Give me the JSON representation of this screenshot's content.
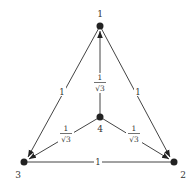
{
  "diagram": {
    "type": "directed-weighted-graph",
    "nodes": [
      {
        "id": "1",
        "label": "1",
        "x": 100,
        "y": 26
      },
      {
        "id": "2",
        "label": "2",
        "x": 174,
        "y": 162
      },
      {
        "id": "3",
        "label": "3",
        "x": 24,
        "y": 162
      },
      {
        "id": "4",
        "label": "4",
        "x": 100,
        "y": 117
      }
    ],
    "edges": [
      {
        "from": "1",
        "to": "3",
        "weight": "1"
      },
      {
        "from": "1",
        "to": "2",
        "weight": "1"
      },
      {
        "from": "3",
        "to": "2",
        "weight": "1"
      },
      {
        "from": "4",
        "to": "1",
        "weight": "1/√3",
        "num": "1",
        "den": "√3"
      },
      {
        "from": "4",
        "to": "3",
        "weight": "1/√3",
        "num": "1",
        "den": "√3"
      },
      {
        "from": "4",
        "to": "2",
        "weight": "1/√3",
        "num": "1",
        "den": "√3"
      }
    ]
  }
}
